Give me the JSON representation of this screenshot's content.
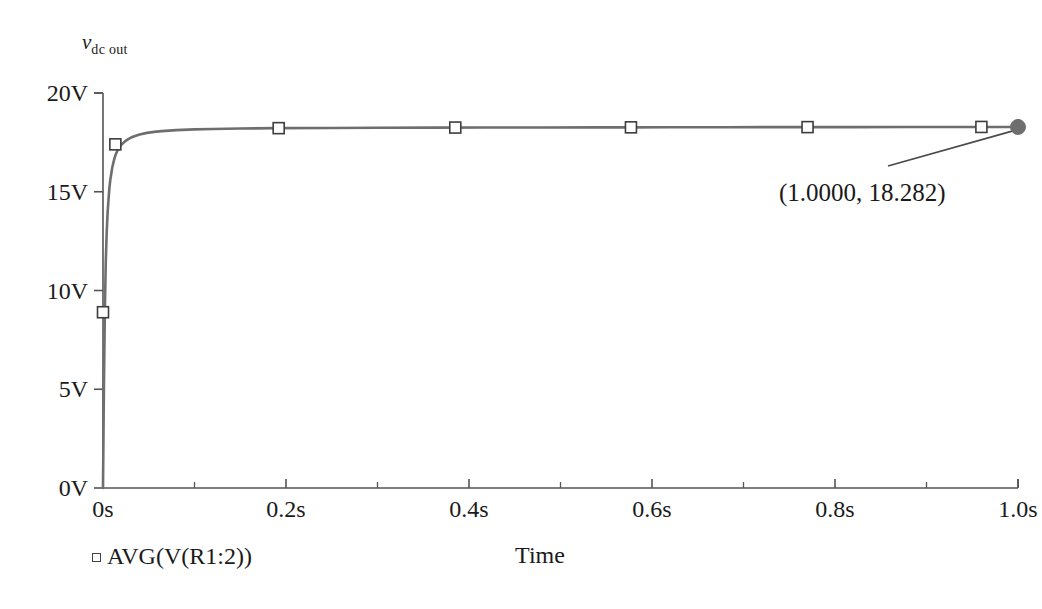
{
  "chart_data": {
    "type": "line",
    "title": "",
    "ylabel": "v",
    "ylabel_subscript": "dc out",
    "xlabel": "Time",
    "xlim": [
      0,
      1.0
    ],
    "ylim": [
      0,
      20
    ],
    "grid": false,
    "legend_position": "bottom-left",
    "x_tick_labels": [
      "0s",
      "0.2s",
      "0.4s",
      "0.6s",
      "0.8s",
      "1.0s"
    ],
    "x_tick_values": [
      0,
      0.2,
      0.4,
      0.6,
      0.8,
      1.0
    ],
    "x_minor_tick_values": [
      0.1,
      0.3,
      0.5,
      0.7,
      0.9
    ],
    "y_tick_labels": [
      "0V",
      "5V",
      "10V",
      "15V",
      "20V"
    ],
    "y_tick_values": [
      0,
      5,
      10,
      15,
      20
    ],
    "series": [
      {
        "name": "AVG(V(R1:2))",
        "color": "#6e6e6e",
        "marker": "open-square",
        "x": [
          0.0,
          0.0005,
          0.001,
          0.002,
          0.003,
          0.004,
          0.005,
          0.006,
          0.007,
          0.008,
          0.009,
          0.01,
          0.012,
          0.014,
          0.016,
          0.018,
          0.02,
          0.024,
          0.028,
          0.032,
          0.036,
          0.04,
          0.048,
          0.056,
          0.064,
          0.08,
          0.1,
          0.12,
          0.15,
          0.19,
          0.25,
          0.3,
          0.36,
          0.42,
          0.48,
          0.54,
          0.575,
          0.62,
          0.68,
          0.74,
          0.77,
          0.82,
          0.88,
          0.94,
          0.96,
          1.0
        ],
        "y": [
          0.0,
          2.6,
          5.1,
          8.9,
          11.4,
          12.9,
          13.9,
          14.6,
          15.2,
          15.6,
          15.9,
          16.2,
          16.6,
          16.9,
          17.1,
          17.25,
          17.38,
          17.55,
          17.68,
          17.77,
          17.84,
          17.9,
          17.98,
          18.03,
          18.07,
          18.12,
          18.16,
          18.18,
          18.2,
          18.22,
          18.23,
          18.24,
          18.245,
          18.25,
          18.255,
          18.26,
          18.262,
          18.265,
          18.268,
          18.271,
          18.272,
          18.274,
          18.277,
          18.28,
          18.281,
          18.282
        ],
        "marker_points": [
          {
            "x": 0.0,
            "y": 8.9
          },
          {
            "x": 0.0135,
            "y": 17.4
          },
          {
            "x": 0.192,
            "y": 18.22
          },
          {
            "x": 0.385,
            "y": 18.25
          },
          {
            "x": 0.577,
            "y": 18.262
          },
          {
            "x": 0.77,
            "y": 18.272
          },
          {
            "x": 0.96,
            "y": 18.281
          }
        ]
      }
    ],
    "cursor": {
      "x": 1.0,
      "y": 18.282,
      "label": "(1.0000, 18.282)",
      "marker": "filled-circle",
      "color": "#6e6e6e"
    },
    "legend": [
      {
        "label": "AVG(V(R1:2))",
        "marker": "open-square"
      }
    ]
  }
}
